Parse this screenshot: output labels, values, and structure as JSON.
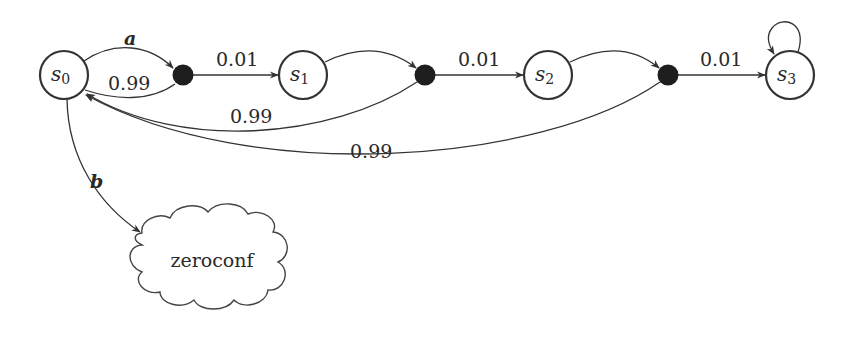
{
  "diagram": {
    "type": "markov-decision-process",
    "states": [
      {
        "id": "s0",
        "base": "s",
        "sub": "0"
      },
      {
        "id": "s1",
        "base": "s",
        "sub": "1"
      },
      {
        "id": "s2",
        "base": "s",
        "sub": "2"
      },
      {
        "id": "s3",
        "base": "s",
        "sub": "3"
      }
    ],
    "actions": {
      "a": "a",
      "b": "b"
    },
    "edge_labels": {
      "d1_to_s1": "0.01",
      "d1_to_s0": "0.99",
      "d2_to_s2": "0.01",
      "d2_to_s0": "0.99",
      "d3_to_s3": "0.01",
      "d3_to_s0": "0.99"
    },
    "cloud": {
      "label": "zeroconf"
    }
  }
}
